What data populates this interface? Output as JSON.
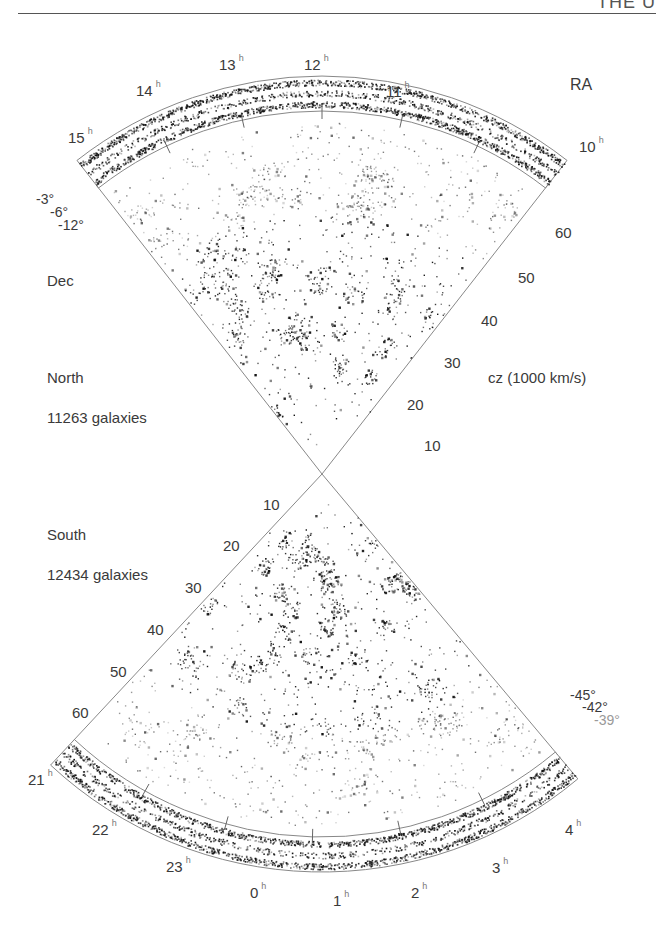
{
  "header": {
    "running_title": "THE U"
  },
  "chart_data": {
    "type": "scatter",
    "subtype": "polar-wedge (redshift survey cone diagram)",
    "title": "",
    "axes": {
      "radial_label": "cz (1000 km/s)",
      "radial_ticks": [
        10,
        20,
        30,
        40,
        50,
        60
      ],
      "radial_range": [
        0,
        60
      ],
      "angular_label": "RA",
      "dec_label": "Dec"
    },
    "north": {
      "label": "North",
      "count_text": "11263 galaxies",
      "galaxy_count": 11263,
      "ra_ticks": [
        "15",
        "14",
        "13",
        "12",
        "11",
        "10"
      ],
      "ra_unit": "h",
      "dec_strips": [
        "-3°",
        "-6°",
        "-12°"
      ]
    },
    "south": {
      "label": "South",
      "count_text": "12434 galaxies",
      "galaxy_count": 12434,
      "ra_ticks": [
        "21",
        "22",
        "23",
        "0",
        "1",
        "2",
        "3",
        "4"
      ],
      "ra_unit": "h",
      "dec_strips": [
        "-45°",
        "-42°",
        "-39°"
      ]
    },
    "legend": null,
    "grid": false
  },
  "labels": {
    "ra": "RA",
    "dec": "Dec",
    "cz": "cz (1000 km/s)",
    "north": "North",
    "north_count": "11263 galaxies",
    "south": "South",
    "south_count": "12434 galaxies",
    "ra_north": {
      "h15": "15",
      "h14": "14",
      "h13": "13",
      "h12": "12",
      "h11": "11",
      "h10": "10"
    },
    "ra_south": {
      "h21": "21",
      "h22": "22",
      "h23": "23",
      "h0": "0",
      "h1": "1",
      "h2": "2",
      "h3": "3",
      "h4": "4"
    },
    "h": "h",
    "dec_north": {
      "d3": "-3°",
      "d6": "-6°",
      "d12": "-12°"
    },
    "dec_south": {
      "d45": "-45°",
      "d42": "-42°",
      "d39": "-39°"
    },
    "cz_north": {
      "t10": "10",
      "t20": "20",
      "t30": "30",
      "t40": "40",
      "t50": "50",
      "t60": "60"
    },
    "cz_south": {
      "t10": "10",
      "t20": "20",
      "t30": "30",
      "t40": "40",
      "t50": "50",
      "t60": "60"
    }
  },
  "render": {
    "center": [
      322,
      474
    ],
    "r60": 357,
    "band_outer": 398,
    "north_angles_deg": [
      -128,
      -52
    ],
    "south_angles_deg": [
      50,
      133
    ],
    "point_color": "#111111",
    "line_color": "#888888"
  }
}
